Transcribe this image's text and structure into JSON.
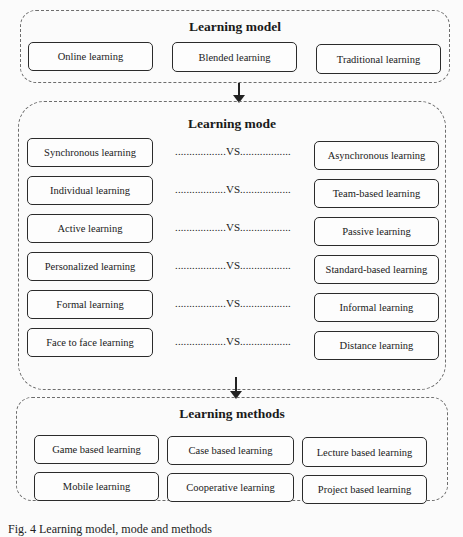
{
  "learning_model": {
    "title": "Learning model",
    "items": [
      "Online learning",
      "Blended learning",
      "Traditional learning"
    ]
  },
  "learning_mode": {
    "title": "Learning mode",
    "separator_dots": "..................",
    "separator_label": "VS",
    "pairs": [
      {
        "left": "Synchronous learning",
        "right": "Asynchronous learning"
      },
      {
        "left": "Individual learning",
        "right": "Team-based learning"
      },
      {
        "left": "Active learning",
        "right": "Passive learning"
      },
      {
        "left": "Personalized learning",
        "right": "Standard-based learning"
      },
      {
        "left": "Formal learning",
        "right": "Informal learning"
      },
      {
        "left": "Face to face learning",
        "right": "Distance learning"
      }
    ]
  },
  "learning_methods": {
    "title": "Learning methods",
    "items": [
      "Game based learning",
      "Case based learning",
      "Lecture based learning",
      "Mobile learning",
      "Cooperative learning",
      "Project based learning"
    ]
  },
  "caption": "Fig. 4 Learning model, mode and methods"
}
